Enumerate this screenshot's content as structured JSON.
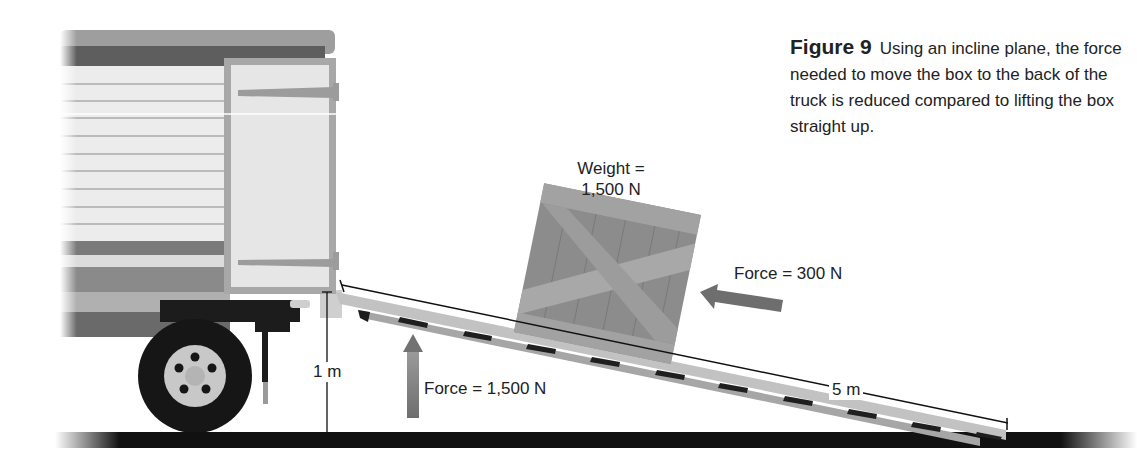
{
  "figure": {
    "number": "Figure 9",
    "caption": "Using an incline plane, the force needed to move the box to the back of the truck is reduced compared to lifting the box straight up."
  },
  "labels": {
    "weight_line1": "Weight =",
    "weight_line2": "1,500 N",
    "force_incline": "Force = 300 N",
    "force_lift": "Force = 1,500 N",
    "height": "1 m",
    "ramp_length": "5 m"
  },
  "colors": {
    "background": "#ffffff",
    "ground": "#111111",
    "truck_body": "#d8d8d8",
    "truck_dark": "#555555",
    "crate": "#8f8f8f",
    "crate_light": "#a6a6a6",
    "arrow": "#666666",
    "ramp": "#b8b8b8",
    "text": "#222222"
  },
  "diagram": {
    "elements": [
      "truck",
      "door",
      "wheel",
      "ramp",
      "crate",
      "ground",
      "force-arrow-up",
      "force-arrow-incline",
      "height-dimension",
      "length-dimension"
    ],
    "incline": {
      "height_m": 1,
      "length_m": 5,
      "weight_N": 1500,
      "lift_force_N": 1500,
      "incline_force_N": 300
    }
  }
}
